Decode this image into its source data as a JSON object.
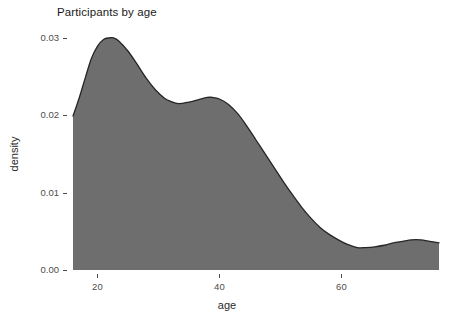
{
  "chart_data": {
    "type": "area",
    "title": "Participants by age",
    "xlabel": "age",
    "ylabel": "density",
    "grid": false,
    "legend": null,
    "xlim": [
      16.0,
      76.0
    ],
    "ylim": [
      0.0,
      0.0305
    ],
    "xticks": [
      20,
      40,
      60
    ],
    "xtick_labels": [
      "20",
      "40",
      "60"
    ],
    "yticks": [
      0.0,
      0.01,
      0.02,
      0.03
    ],
    "ytick_labels": [
      "0.00",
      "0.01",
      "0.02",
      "0.03"
    ],
    "fill_color": "#6e6e6e",
    "line_color": "#262626",
    "background_color": "#ffffff",
    "x": [
      16.0,
      17.0,
      18.0,
      19.0,
      20.0,
      21.0,
      22.0,
      22.6,
      23.5,
      25.0,
      26.5,
      28.0,
      29.5,
      31.0,
      32.0,
      33.3,
      35.0,
      36.5,
      38.0,
      38.9,
      40.0,
      41.5,
      43.0,
      44.5,
      46.0,
      47.5,
      49.0,
      50.5,
      52.0,
      53.5,
      55.0,
      56.5,
      58.0,
      59.5,
      61.0,
      62.6,
      64.0,
      65.5,
      67.0,
      68.5,
      70.0,
      71.5,
      73.0,
      74.5,
      76.0
    ],
    "y": [
      0.0199,
      0.0222,
      0.0248,
      0.0273,
      0.0289,
      0.0298,
      0.03,
      0.03,
      0.0296,
      0.0283,
      0.0266,
      0.0248,
      0.0233,
      0.0222,
      0.0218,
      0.0215,
      0.0217,
      0.022,
      0.0223,
      0.0223,
      0.0221,
      0.0214,
      0.0202,
      0.0186,
      0.0168,
      0.015,
      0.0132,
      0.0114,
      0.0097,
      0.0081,
      0.0067,
      0.0055,
      0.0046,
      0.0039,
      0.0033,
      0.0029,
      0.0029,
      0.003,
      0.0032,
      0.0035,
      0.0037,
      0.0039,
      0.0039,
      0.0037,
      0.0035
    ]
  },
  "axes": {
    "title": "Participants by age",
    "x_axis_title": "age",
    "y_axis_title": "density"
  }
}
